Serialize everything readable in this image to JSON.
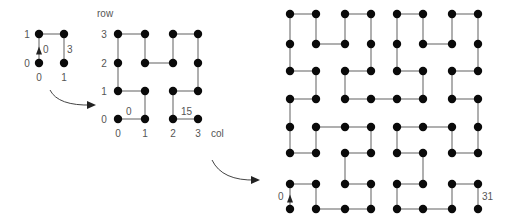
{
  "colors": {
    "node": "#0a0a0a",
    "edge": "#7a7a7a",
    "text": "#555555",
    "arrow": "#444444"
  },
  "grids": [
    {
      "name": "grid-order-1",
      "size": 2,
      "xs": [
        39,
        64
      ],
      "ys": [
        63,
        34
      ],
      "node_radius": 4.2,
      "row_labels": {
        "x": 27,
        "values": [
          "0",
          "1"
        ]
      },
      "col_labels": {
        "y": 81,
        "values": [
          "0",
          "1"
        ]
      },
      "path": [
        [
          0,
          0
        ],
        [
          0,
          1
        ],
        [
          1,
          1
        ],
        [
          1,
          0
        ]
      ],
      "start_arrow": true,
      "edge_labels": [
        {
          "text": "0",
          "x": 43,
          "y": 53
        },
        {
          "text": "3",
          "x": 67,
          "y": 53
        }
      ]
    },
    {
      "name": "grid-order-2",
      "size": 4,
      "xs": [
        118,
        145,
        173,
        198
      ],
      "ys": [
        119,
        91,
        63,
        34
      ],
      "node_radius": 4.2,
      "axis_labels": {
        "row": {
          "text": "row",
          "x": 97,
          "y": 17
        },
        "col": {
          "text": "col",
          "x": 211,
          "y": 137
        }
      },
      "row_labels": {
        "x": 104,
        "values": [
          "0",
          "1",
          "2",
          "3"
        ]
      },
      "col_labels": {
        "y": 137,
        "values": [
          "0",
          "1",
          "2",
          "3"
        ]
      },
      "path": [
        [
          0,
          0
        ],
        [
          1,
          0
        ],
        [
          1,
          1
        ],
        [
          0,
          1
        ],
        [
          0,
          2
        ],
        [
          0,
          3
        ],
        [
          1,
          3
        ],
        [
          1,
          2
        ],
        [
          2,
          2
        ],
        [
          2,
          3
        ],
        [
          3,
          3
        ],
        [
          3,
          2
        ],
        [
          3,
          1
        ],
        [
          2,
          1
        ],
        [
          2,
          0
        ],
        [
          3,
          0
        ]
      ],
      "start_arrow": false,
      "edge_labels": [
        {
          "text": "0",
          "x": 126,
          "y": 115
        },
        {
          "text": "15",
          "x": 181,
          "y": 115
        }
      ]
    },
    {
      "name": "grid-order-3",
      "size": 8,
      "xs": [
        290,
        316,
        345,
        371,
        397,
        423,
        452,
        478
      ],
      "ys": [
        209,
        184,
        153,
        127,
        99,
        71,
        44,
        14
      ],
      "node_radius": 4.2,
      "path": [
        [
          0,
          0
        ],
        [
          0,
          1
        ],
        [
          1,
          1
        ],
        [
          1,
          0
        ],
        [
          2,
          0
        ],
        [
          3,
          0
        ],
        [
          3,
          1
        ],
        [
          2,
          1
        ],
        [
          2,
          2
        ],
        [
          3,
          2
        ],
        [
          3,
          3
        ],
        [
          2,
          3
        ],
        [
          1,
          3
        ],
        [
          1,
          2
        ],
        [
          0,
          2
        ],
        [
          0,
          3
        ],
        [
          0,
          4
        ],
        [
          1,
          4
        ],
        [
          1,
          5
        ],
        [
          0,
          5
        ],
        [
          0,
          6
        ],
        [
          0,
          7
        ],
        [
          1,
          7
        ],
        [
          1,
          6
        ],
        [
          2,
          6
        ],
        [
          2,
          7
        ],
        [
          3,
          7
        ],
        [
          3,
          6
        ],
        [
          3,
          5
        ],
        [
          2,
          5
        ],
        [
          2,
          4
        ],
        [
          3,
          4
        ],
        [
          4,
          4
        ],
        [
          5,
          4
        ],
        [
          5,
          5
        ],
        [
          4,
          5
        ],
        [
          4,
          6
        ],
        [
          4,
          7
        ],
        [
          5,
          7
        ],
        [
          5,
          6
        ],
        [
          6,
          6
        ],
        [
          6,
          7
        ],
        [
          7,
          7
        ],
        [
          7,
          6
        ],
        [
          7,
          5
        ],
        [
          6,
          5
        ],
        [
          6,
          4
        ],
        [
          7,
          4
        ],
        [
          7,
          3
        ],
        [
          7,
          2
        ],
        [
          6,
          2
        ],
        [
          6,
          3
        ],
        [
          5,
          3
        ],
        [
          4,
          3
        ],
        [
          4,
          2
        ],
        [
          5,
          2
        ],
        [
          5,
          1
        ],
        [
          4,
          1
        ],
        [
          4,
          0
        ],
        [
          5,
          0
        ],
        [
          6,
          0
        ],
        [
          6,
          1
        ],
        [
          7,
          1
        ],
        [
          7,
          0
        ]
      ],
      "start_arrow": true,
      "edge_labels": [
        {
          "text": "0",
          "x": 278,
          "y": 200
        },
        {
          "text": "31",
          "x": 482,
          "y": 200
        }
      ]
    }
  ],
  "transition_arrows": [
    {
      "name": "arrow-order1-to-order2",
      "d": "M 50 90 Q 58 106 92 105",
      "head": [
        92,
        105
      ]
    },
    {
      "name": "arrow-order2-to-order3",
      "d": "M 212 160 Q 222 181 256 180",
      "head": [
        256,
        180
      ]
    }
  ]
}
